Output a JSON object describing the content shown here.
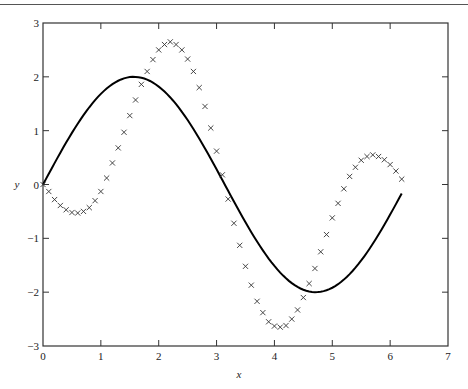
{
  "chart_data": {
    "type": "line",
    "title": "",
    "xlabel": "x",
    "ylabel": "y",
    "xlim": [
      0,
      7
    ],
    "ylim": [
      -3,
      3
    ],
    "grid": false,
    "legend": null,
    "xticks": [
      "0",
      "1",
      "2",
      "3",
      "4",
      "5",
      "6",
      "7"
    ],
    "yticks": [
      "3",
      "2",
      "1",
      "0",
      "−1",
      "−2",
      "−3"
    ],
    "series": [
      {
        "name": "curve",
        "style": "solid-line",
        "color": "#000000",
        "description": "y = 2 sin(x), x from 0 to 6.2",
        "x_start": 0,
        "x_end": 6.2,
        "amplitude": 2
      },
      {
        "name": "markers",
        "style": "x-markers",
        "color": "#333333",
        "x": [
          0.0,
          0.1,
          0.2,
          0.3,
          0.4,
          0.5,
          0.6,
          0.7,
          0.8,
          0.9,
          1.0,
          1.1,
          1.2,
          1.3,
          1.4,
          1.5,
          1.6,
          1.7,
          1.8,
          1.9,
          2.0,
          2.1,
          2.2,
          2.3,
          2.4,
          2.5,
          2.6,
          2.7,
          2.8,
          2.9,
          3.0,
          3.1,
          3.2,
          3.3,
          3.4,
          3.5,
          3.6,
          3.7,
          3.8,
          3.9,
          4.0,
          4.1,
          4.2,
          4.3,
          4.4,
          4.5,
          4.6,
          4.7,
          4.8,
          4.9,
          5.0,
          5.1,
          5.2,
          5.3,
          5.4,
          5.5,
          5.6,
          5.7,
          5.8,
          5.9,
          6.0,
          6.1,
          6.2
        ],
        "y": [
          0.0,
          -0.13,
          -0.28,
          -0.39,
          -0.47,
          -0.52,
          -0.53,
          -0.5,
          -0.43,
          -0.3,
          -0.13,
          0.12,
          0.4,
          0.68,
          0.97,
          1.28,
          1.57,
          1.86,
          2.1,
          2.32,
          2.5,
          2.6,
          2.65,
          2.6,
          2.5,
          2.33,
          2.1,
          1.8,
          1.45,
          1.05,
          0.62,
          0.18,
          -0.27,
          -0.72,
          -1.13,
          -1.52,
          -1.87,
          -2.17,
          -2.38,
          -2.55,
          -2.63,
          -2.65,
          -2.62,
          -2.5,
          -2.33,
          -2.1,
          -1.84,
          -1.56,
          -1.25,
          -0.93,
          -0.62,
          -0.35,
          -0.08,
          0.15,
          0.32,
          0.45,
          0.52,
          0.55,
          0.52,
          0.46,
          0.37,
          0.25,
          0.1
        ]
      }
    ]
  }
}
